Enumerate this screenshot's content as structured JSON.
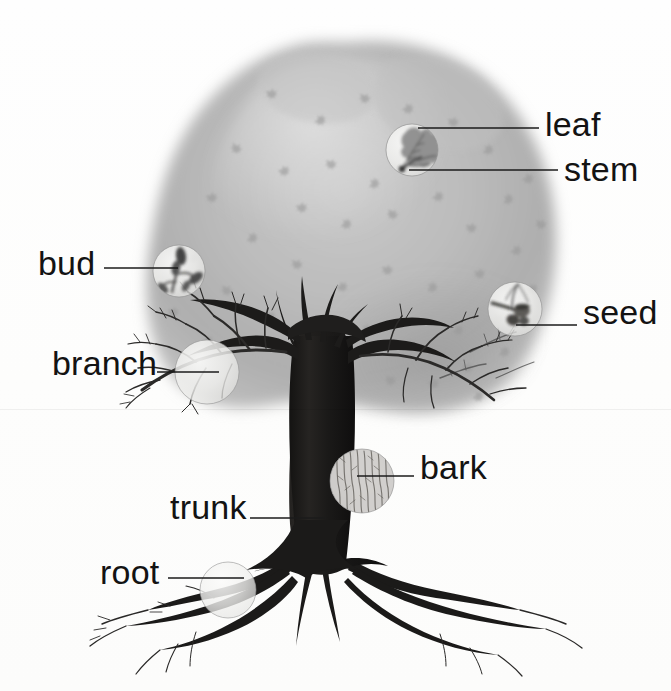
{
  "diagram": {
    "style": "grayscale watercolor botanical illustration",
    "background_color": "#fdfdfc",
    "ink_color": "#131313",
    "canopy_color": "#b9b9b9",
    "trunk_color": "#1f1d1c"
  },
  "labels": [
    {
      "id": "leaf",
      "text": "leaf",
      "x": 545,
      "y": 107,
      "size": 34
    },
    {
      "id": "stem",
      "text": "stem",
      "x": 564,
      "y": 152,
      "size": 34
    },
    {
      "id": "bud",
      "text": "bud",
      "x": 38,
      "y": 246,
      "size": 34
    },
    {
      "id": "seed",
      "text": "seed",
      "x": 583,
      "y": 295,
      "size": 34
    },
    {
      "id": "branch",
      "text": "branch",
      "x": 52,
      "y": 346,
      "size": 34
    },
    {
      "id": "bark",
      "text": "bark",
      "x": 420,
      "y": 450,
      "size": 34
    },
    {
      "id": "trunk",
      "text": "trunk",
      "x": 170,
      "y": 490,
      "size": 34
    },
    {
      "id": "root",
      "text": "root",
      "x": 100,
      "y": 555,
      "size": 34
    }
  ],
  "leader_lines": [
    {
      "id": "leaf-leader",
      "x": 421,
      "y": 128,
      "width": 118
    },
    {
      "id": "stem-leader",
      "x": 413,
      "y": 172,
      "width": 145
    },
    {
      "id": "bud-leader",
      "x": 106,
      "y": 268,
      "width": 72
    },
    {
      "id": "seed-leader",
      "x": 515,
      "y": 325,
      "width": 62
    },
    {
      "id": "branch-leader",
      "x": 158,
      "y": 372,
      "width": 61
    },
    {
      "id": "bark-leader",
      "x": 358,
      "y": 476,
      "width": 56
    },
    {
      "id": "trunk-leader",
      "x": 251,
      "y": 518,
      "width": 74
    },
    {
      "id": "root-leader",
      "x": 170,
      "y": 578,
      "width": 75
    }
  ],
  "magnifiers": [
    {
      "id": "leaf-magnifier",
      "cx": 412,
      "cy": 150,
      "r": 26,
      "detail": "lobed oak leaf with stem"
    },
    {
      "id": "bud-magnifier",
      "cx": 179,
      "cy": 271,
      "r": 26,
      "detail": "twig with swelling buds"
    },
    {
      "id": "seed-magnifier",
      "cx": 515,
      "cy": 309,
      "r": 27,
      "detail": "acorn seed on twig"
    },
    {
      "id": "branch-magnifier",
      "cx": 207,
      "cy": 372,
      "r": 32,
      "detail": "forking branch"
    },
    {
      "id": "bark-magnifier",
      "cx": 362,
      "cy": 481,
      "r": 32,
      "detail": "vertical furrowed bark texture"
    },
    {
      "id": "root-magnifier",
      "cx": 228,
      "cy": 590,
      "r": 28,
      "detail": "root tapering into rootlets"
    }
  ]
}
